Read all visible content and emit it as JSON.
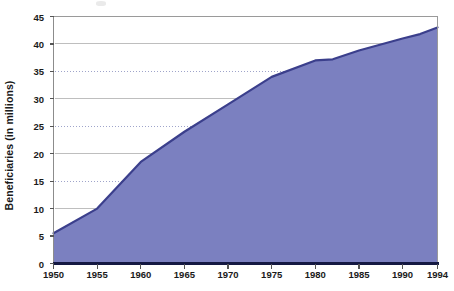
{
  "chart_data": {
    "type": "area",
    "title": "",
    "xlabel": "",
    "ylabel": "Beneficiaries (in millions)",
    "xlim": [
      1950,
      1994
    ],
    "ylim": [
      0,
      45
    ],
    "grid": true,
    "legend": "none",
    "x_tick_labels": [
      "1950",
      "1955",
      "1960",
      "1965",
      "1970",
      "1975",
      "1980",
      "1985",
      "1990",
      "1994"
    ],
    "x_ticks": [
      1950,
      1955,
      1960,
      1965,
      1970,
      1975,
      1980,
      1985,
      1990,
      1994
    ],
    "y_tick_labels": [
      "0",
      "5",
      "10",
      "15",
      "20",
      "25",
      "30",
      "35",
      "40",
      "45"
    ],
    "y_ticks": [
      0,
      5,
      10,
      15,
      20,
      25,
      30,
      35,
      40,
      45
    ],
    "x": [
      1950,
      1955,
      1960,
      1965,
      1970,
      1975,
      1980,
      1982,
      1985,
      1990,
      1992,
      1994
    ],
    "values": [
      5.5,
      10.0,
      18.5,
      24.0,
      29.0,
      34.0,
      37.0,
      37.2,
      38.8,
      41.0,
      41.8,
      43.0
    ],
    "series": [
      {
        "name": "Beneficiaries",
        "values": [
          5.5,
          10.0,
          18.5,
          24.0,
          29.0,
          34.0,
          37.0,
          37.2,
          38.8,
          41.0,
          41.8,
          43.0
        ]
      }
    ]
  },
  "style": {
    "area_fill": "#7b80c0",
    "line_color": "#3b3f8c",
    "axis_color": "#808080",
    "grid_color": "#9aa0c8",
    "baseline_color": "#141842",
    "text_color": "#1a1a1a"
  }
}
